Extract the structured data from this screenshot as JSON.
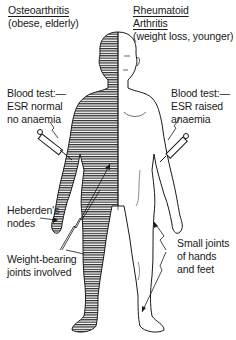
{
  "diagram": {
    "title_left": {
      "heading": "Osteoarthritis",
      "subtitle": "(obese, elderly)"
    },
    "title_right": {
      "heading_line1": "Rheumatoid",
      "heading_line2": "Arthritis",
      "subtitle": "(weight loss, younger)"
    },
    "labels": {
      "blood_left_1": "Blood test:—",
      "blood_left_2": "ESR normal",
      "blood_left_3": "no anaemia",
      "blood_right_1": "Blood test:—",
      "blood_right_2": "ESR raised",
      "blood_right_3": "anaemia",
      "heberden_1": "Heberden's",
      "heberden_2": "nodes",
      "weight_1": "Weight-bearing",
      "weight_2": "joints involved",
      "small_1": "Small joints",
      "small_2": "of hands",
      "small_3": "and feet"
    },
    "colors": {
      "ink": "#1a1a1a",
      "background": "#ffffff"
    }
  }
}
